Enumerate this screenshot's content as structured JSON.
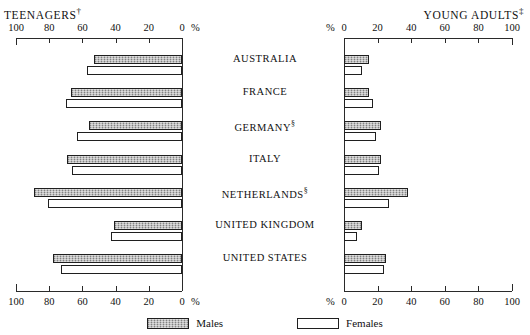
{
  "panels": {
    "left": {
      "title": "TEENAGERS",
      "marker": "†",
      "unit": "%"
    },
    "right": {
      "title": "YOUNG ADULTS",
      "marker": "‡",
      "unit": "%"
    }
  },
  "legend": {
    "male": {
      "label": "Males",
      "swatch": "shaded-grey"
    },
    "female": {
      "label": "Females",
      "swatch": "white-outline"
    }
  },
  "chart_data": {
    "type": "bar",
    "orientation": "horizontal",
    "title": "",
    "layout": "paired back-to-back panels",
    "categories": [
      "AUSTRALIA",
      "FRANCE",
      "GERMANY",
      "ITALY",
      "NETHERLANDS",
      "UNITED KINGDOM",
      "UNITED STATES"
    ],
    "category_markers": [
      "",
      "",
      "§",
      "",
      "§",
      "",
      ""
    ],
    "panels": [
      {
        "name": "TEENAGERS",
        "side": "left",
        "direction": "right-to-left",
        "xlabel": "%",
        "xlim": [
          0,
          100
        ],
        "ticks": [
          100,
          80,
          60,
          40,
          20,
          0
        ],
        "series": [
          {
            "name": "Males",
            "values": [
              53,
              67,
              56,
              69,
              89,
              41,
              78
            ]
          },
          {
            "name": "Females",
            "values": [
              57,
              70,
              63,
              66,
              81,
              43,
              73
            ]
          }
        ]
      },
      {
        "name": "YOUNG ADULTS",
        "side": "right",
        "direction": "left-to-right",
        "xlabel": "%",
        "xlim": [
          0,
          100
        ],
        "ticks": [
          0,
          20,
          40,
          60,
          80,
          100
        ],
        "series": [
          {
            "name": "Males",
            "values": [
              15,
              15,
              22,
              22,
              38,
              11,
              25
            ]
          },
          {
            "name": "Females",
            "values": [
              11,
              17,
              19,
              21,
              27,
              8,
              24
            ]
          }
        ]
      }
    ],
    "grid": false,
    "legend_position": "bottom-center",
    "colors": {
      "male": "#a8a8a8",
      "female": "#ffffff",
      "axis": "#2a2a2a"
    }
  }
}
